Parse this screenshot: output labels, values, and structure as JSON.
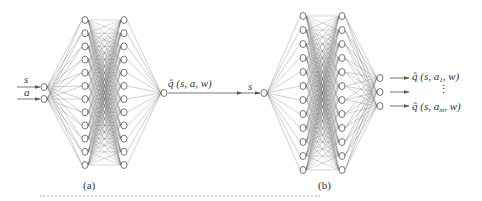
{
  "figure": {
    "panel_a": {
      "caption": "(a)",
      "inputs": [
        "s",
        "a"
      ],
      "output_label": "q̂ (s,  a,  w)",
      "layers": {
        "input_nodes": 2,
        "hidden1_nodes": 12,
        "hidden2_nodes": 12,
        "output_nodes": 1
      }
    },
    "panel_b": {
      "caption": "(b)",
      "inputs": [
        "s"
      ],
      "output_labels": [
        {
          "prefix": "q̂ (s,  a",
          "sub": "1",
          "suffix": ",  w)"
        },
        {
          "prefix": "⋮",
          "sub": "",
          "suffix": ""
        },
        {
          "prefix": "q̂ (s,  a",
          "sub": "m",
          "suffix": ",  w)"
        }
      ],
      "layers": {
        "input_nodes": 1,
        "hidden1_nodes": 12,
        "hidden2_nodes": 12,
        "output_nodes": 3
      }
    },
    "colors": {
      "stroke": "#555555",
      "edge": "#6a6a6a",
      "text": "#333333",
      "background": "#ffffff"
    }
  }
}
